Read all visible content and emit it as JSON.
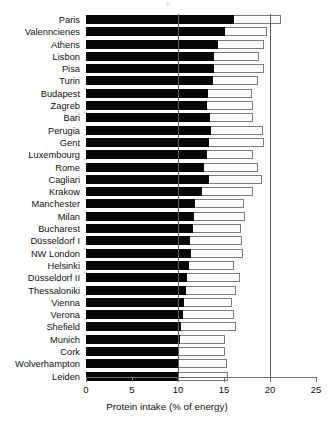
{
  "chart_data": {
    "type": "bar",
    "orientation": "horizontal",
    "title": "",
    "xlabel": "Protein intake (% of energy)",
    "ylabel": "",
    "xlim": [
      0,
      25
    ],
    "ylim": null,
    "xticks": [
      0,
      5,
      10,
      15,
      20,
      25
    ],
    "xtick_labels": [
      "0",
      "5",
      "10",
      "15",
      "20",
      "25"
    ],
    "grid": false,
    "legend": null,
    "reference_lines": [
      {
        "x": 10,
        "style": "solid",
        "color": "#5b5b5b"
      },
      {
        "x": 20,
        "style": "solid",
        "color": "#5b5b5b"
      }
    ],
    "categories": [
      "Paris",
      "Valenncienes",
      "Athens",
      "Lisbon",
      "Pisa",
      "Turin",
      "Budapest",
      "Zagreb",
      "Bari",
      "Perugia",
      "Gent",
      "Luxembourg",
      "Rome",
      "Cagliari",
      "Krakow",
      "Manchester",
      "Milan",
      "Bucharest",
      "Düsseldorf I",
      "NW London",
      "Helsinki",
      "Düsseldorf II",
      "Thessaloniki",
      "Vienna",
      "Verona",
      "Shefield",
      "Munich",
      "Cork",
      "Wolverhampton",
      "Leiden"
    ],
    "series": [
      {
        "name": "outer-bar-total",
        "style": "white bar with grey outline",
        "values": [
          21.2,
          19.7,
          19.3,
          18.8,
          19.3,
          18.7,
          18.0,
          18.1,
          18.1,
          19.2,
          19.3,
          18.1,
          18.7,
          19.1,
          18.1,
          17.2,
          17.3,
          16.8,
          17.0,
          17.1,
          16.1,
          16.7,
          16.3,
          15.9,
          16.1,
          16.3,
          15.1,
          15.1,
          15.3,
          15.4
        ]
      },
      {
        "name": "inner-bar",
        "style": "solid black bar",
        "values": [
          16.1,
          15.1,
          14.3,
          13.9,
          13.9,
          13.8,
          13.3,
          13.1,
          13.5,
          13.6,
          13.4,
          13.2,
          12.8,
          13.4,
          12.6,
          11.9,
          11.7,
          11.6,
          11.3,
          11.4,
          11.2,
          11.0,
          10.9,
          10.6,
          10.5,
          10.3,
          10.2,
          10.1,
          10.1,
          10.1
        ]
      }
    ],
    "colors": {
      "inner": "#070707",
      "outer_fill": "#ffffff",
      "outer_stroke": "#7d7d7d",
      "axis": "#6f6f6f",
      "text": "#111111"
    }
  }
}
